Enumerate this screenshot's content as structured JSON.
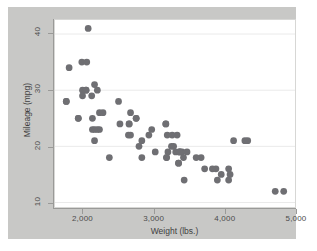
{
  "figure": {
    "background_color": "#ffffff",
    "graph_region_color": "#c8c8c6",
    "plot_region_color": "#ffffff"
  },
  "chart_data": {
    "type": "scatter",
    "title": "",
    "subtitle": "",
    "xlabel": "Weight (lbs.)",
    "ylabel": "Mileage (mpg)",
    "xlim": [
      1600,
      5000
    ],
    "ylim": [
      9.2,
      42.5
    ],
    "xticks": [
      2000,
      3000,
      4000,
      5000
    ],
    "xticklabels": [
      "2,000",
      "3,000",
      "4,000",
      "5,000"
    ],
    "yticks": [
      10,
      20,
      30,
      40
    ],
    "yticklabels": [
      "10",
      "20",
      "30",
      "40"
    ],
    "grid": true,
    "gridlines": "horizontal",
    "grid_color": "#eaeaea",
    "legend": null,
    "marker": {
      "shape": "circle",
      "color": "#6f6f73",
      "size": 3.4
    },
    "annotations": [],
    "series": [
      {
        "name": "Mileage vs Weight",
        "x": [
          2930,
          3350,
          2640,
          3250,
          4080,
          3670,
          2230,
          3280,
          3880,
          3400,
          3020,
          3180,
          4330,
          3900,
          4290,
          4720,
          3430,
          3180,
          4060,
          3600,
          3350,
          2500,
          3330,
          2200,
          2520,
          2130,
          1800,
          2230,
          2830,
          2200,
          2650,
          2750,
          2970,
          1980,
          3310,
          3370,
          2830,
          3370,
          2790,
          3470,
          3190,
          3200,
          3420,
          3260,
          4130,
          3720,
          3955,
          3830,
          4840,
          4060,
          3360,
          1760,
          2050,
          2120,
          2670,
          2160,
          1930,
          1990,
          3170,
          2670,
          2370,
          2280,
          2750,
          2130,
          2650,
          1760,
          2070,
          2160,
          2040,
          1930,
          1990,
          3170,
          2160,
          2040
        ],
        "y": [
          22,
          17,
          22,
          20,
          15,
          18,
          26,
          20,
          16,
          19,
          19,
          18,
          21,
          14,
          21,
          12,
          14,
          18,
          16,
          18,
          17,
          28,
          22,
          30,
          24,
          25,
          34,
          23,
          21,
          23,
          24,
          25,
          23,
          35,
          19,
          19,
          18,
          19,
          20,
          19,
          22,
          19,
          18,
          22,
          21,
          16,
          15,
          16,
          12,
          14,
          19,
          28,
          35,
          29,
          26,
          31,
          25,
          30,
          24,
          22,
          18,
          26,
          25,
          23,
          24,
          28,
          41,
          21,
          30,
          25,
          29,
          24,
          23,
          30
        ]
      }
    ]
  },
  "axes": {
    "x_title": "Weight (lbs.)",
    "y_title": "Mileage (mpg)",
    "x_tick_labels": [
      "2,000",
      "3,000",
      "4,000",
      "5,000"
    ],
    "y_tick_labels": [
      "10",
      "20",
      "30",
      "40"
    ]
  }
}
